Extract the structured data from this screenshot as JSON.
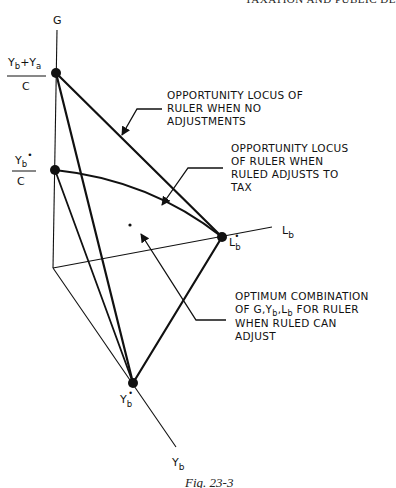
{
  "header": {
    "running_head": "TAXATION AND PUBLIC DE"
  },
  "axes": {
    "g_label": "G",
    "lb_label": "L",
    "lb_sub": "b",
    "yb_label": "Y",
    "yb_sub": "b"
  },
  "points": {
    "top": {
      "num_a": "Y",
      "num_a_sub": "b",
      "plus": "+",
      "num_b": "Y",
      "num_b_sub": "a",
      "den": "C"
    },
    "mid": {
      "num": "Y",
      "num_sub": "b",
      "star": "•",
      "den": "C"
    },
    "lb_star": {
      "label": "L",
      "sub": "b",
      "star": "•"
    },
    "yb_star": {
      "label": "Y",
      "sub": "b",
      "star": "•"
    }
  },
  "annotations": {
    "no_adjust": [
      "OPPORTUNITY LOCUS OF",
      "RULER WHEN NO",
      "ADJUSTMENTS"
    ],
    "adjusts_to_tax": [
      "OPPORTUNITY LOCUS",
      "OF RULER WHEN",
      "RULED ADJUSTS TO",
      "TAX"
    ],
    "optimum": {
      "line1": "OPTIMUM COMBINATION",
      "line2_a": "OF G,Y",
      "line2_sub1": "b",
      "line2_b": ",L",
      "line2_sub2": "b",
      "line2_c": " FOR RULER",
      "line3": "WHEN RULED CAN",
      "line4": "ADJUST"
    }
  },
  "caption": "Fig. 23-3"
}
